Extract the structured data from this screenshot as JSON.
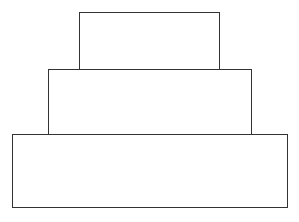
{
  "diagram": {
    "type": "stacked-tiers",
    "stroke_color": "#333333",
    "background": "#ffffff",
    "tiers": [
      {
        "name": "top-tier",
        "x": 79,
        "y": 12,
        "width": 141,
        "height": 58
      },
      {
        "name": "middle-tier",
        "x": 48,
        "y": 69,
        "width": 204,
        "height": 66
      },
      {
        "name": "bottom-tier",
        "x": 12,
        "y": 134,
        "width": 276,
        "height": 74
      }
    ]
  }
}
